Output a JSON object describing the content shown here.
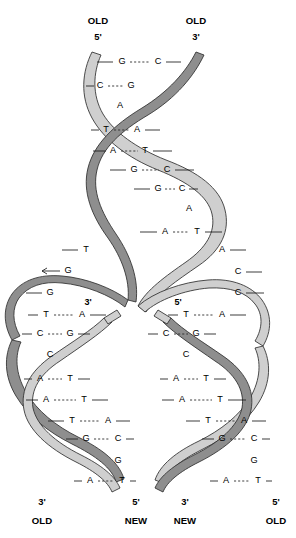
{
  "figure": {
    "colors": {
      "old_strand": "#8e8e8e",
      "new_strand": "#cfcfcf",
      "outline": "#2e2e2e",
      "background": "#ffffff",
      "text": "#000000"
    }
  },
  "top_labels": {
    "left": {
      "strand": "OLD",
      "prime": "5'"
    },
    "right": {
      "strand": "OLD",
      "prime": "3'"
    }
  },
  "bottom_labels": {
    "left_branch_left": {
      "prime": "3'",
      "strand": "OLD"
    },
    "left_branch_right": {
      "prime": "5'",
      "strand": "NEW"
    },
    "right_branch_left": {
      "prime": "3'",
      "strand": "NEW"
    },
    "right_branch_right": {
      "prime": "5'",
      "strand": "OLD"
    }
  },
  "fork_labels": {
    "left_new_3prime": "3'",
    "right_new_5prime": "5'"
  },
  "parent_helix": {
    "name": "parent-duplex",
    "pairs": [
      {
        "left": "G",
        "right": "C",
        "paired": true
      },
      {
        "left": "C",
        "right": "G",
        "paired": true
      },
      {
        "left": "",
        "right": "A",
        "paired": false
      },
      {
        "left": "T",
        "right": "A",
        "paired": true
      },
      {
        "left": "A",
        "right": "T",
        "paired": true
      },
      {
        "left": "G",
        "right": "C",
        "paired": true
      },
      {
        "left": "G",
        "right": "C",
        "paired": true
      },
      {
        "left": "",
        "right": "A",
        "paired": false
      },
      {
        "left": "A",
        "right": "T",
        "paired": true
      }
    ]
  },
  "fork_unpaired": {
    "left_template": [
      "T",
      "G",
      "G"
    ],
    "right_template": [
      "A",
      "C",
      "C"
    ]
  },
  "left_daughter_helix": {
    "name": "left-daughter-duplex",
    "pairs": [
      {
        "left": "T",
        "right": "A",
        "paired": true
      },
      {
        "left": "C",
        "right": "G",
        "paired": true
      },
      {
        "left": "C",
        "right": "",
        "paired": false
      },
      {
        "left": "A",
        "right": "T",
        "paired": true
      },
      {
        "left": "A",
        "right": "T",
        "paired": true
      },
      {
        "left": "T",
        "right": "A",
        "paired": true
      },
      {
        "left": "G",
        "right": "C",
        "paired": true
      },
      {
        "left": "G",
        "right": "",
        "paired": false
      },
      {
        "left": "A",
        "right": "T",
        "paired": true
      }
    ]
  },
  "right_daughter_helix": {
    "name": "right-daughter-duplex",
    "pairs": [
      {
        "left": "T",
        "right": "A",
        "paired": true
      },
      {
        "left": "C",
        "right": "G",
        "paired": true
      },
      {
        "left": "C",
        "right": "",
        "paired": false
      },
      {
        "left": "A",
        "right": "T",
        "paired": true
      },
      {
        "left": "A",
        "right": "T",
        "paired": true
      },
      {
        "left": "T",
        "right": "A",
        "paired": true
      },
      {
        "left": "G",
        "right": "C",
        "paired": true
      },
      {
        "left": "G",
        "right": "",
        "paired": false
      },
      {
        "left": "A",
        "right": "T",
        "paired": true
      }
    ]
  }
}
